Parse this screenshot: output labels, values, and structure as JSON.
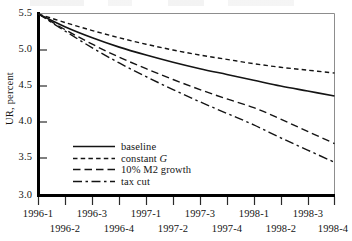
{
  "chart_data": {
    "type": "line",
    "title": "",
    "xlabel": "",
    "ylabel": "UR, percent",
    "ylim": [
      3.0,
      5.5
    ],
    "yticks": [
      "3.0",
      "3.5",
      "4.0",
      "4.5",
      "5.0",
      "5.5"
    ],
    "grid": false,
    "legend_position": "inside-lower-left",
    "x": [
      "1996-1",
      "1996-2",
      "1996-3",
      "1996-4",
      "1997-1",
      "1997-2",
      "1997-3",
      "1997-4",
      "1998-1",
      "1998-2",
      "1998-3",
      "1998-4"
    ],
    "categories": [
      "1996-1",
      "1996-2",
      "1996-3",
      "1996-4",
      "1997-1",
      "1997-2",
      "1997-3",
      "1997-4",
      "1998-1",
      "1998-2",
      "1998-3",
      "1998-4"
    ],
    "series": [
      {
        "name": "baseline",
        "style": "solid",
        "values": [
          5.5,
          5.32,
          5.17,
          5.04,
          4.93,
          4.83,
          4.74,
          4.66,
          4.58,
          4.5,
          4.43,
          4.36
        ]
      },
      {
        "name": "constant G",
        "style": "dotted",
        "values": [
          5.5,
          5.38,
          5.27,
          5.17,
          5.08,
          5.0,
          4.93,
          4.87,
          4.81,
          4.76,
          4.72,
          4.68
        ]
      },
      {
        "name": "10% M2 growth",
        "style": "dashed",
        "values": [
          5.5,
          5.28,
          5.08,
          4.9,
          4.74,
          4.59,
          4.45,
          4.32,
          4.2,
          4.04,
          3.87,
          3.7
        ]
      },
      {
        "name": "tax cut",
        "style": "dash-dot",
        "values": [
          5.5,
          5.26,
          5.03,
          4.82,
          4.63,
          4.45,
          4.28,
          4.12,
          3.96,
          3.78,
          3.61,
          3.44
        ]
      }
    ]
  },
  "axes": {
    "y_title": "UR, percent",
    "y_ticks": [
      "5.5",
      "5.0",
      "4.5",
      "4.0",
      "3.5",
      "3.0"
    ],
    "x_ticks_upper": [
      "1996-1",
      "1996-3",
      "1997-1",
      "1997-3",
      "1998-1",
      "1998-3"
    ],
    "x_ticks_lower": [
      "1996-2",
      "1996-4",
      "1997-2",
      "1997-4",
      "1998-2",
      "1998-4"
    ]
  },
  "legend": {
    "entries": [
      {
        "label": "baseline",
        "label_suffix": "",
        "style": "solid"
      },
      {
        "label": "constant ",
        "label_suffix": "G",
        "style": "dotted"
      },
      {
        "label": "10% M2 growth",
        "label_suffix": "",
        "style": "dashed"
      },
      {
        "label": "tax cut",
        "label_suffix": "",
        "style": "dash-dot"
      }
    ]
  },
  "colors": {
    "ink": "#141414",
    "frame_major": "#000000",
    "frame_minor": "#8d8d8d",
    "background": "#ffffff"
  }
}
